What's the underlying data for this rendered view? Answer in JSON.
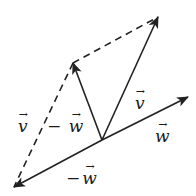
{
  "diagram": {
    "stroke_color": "#222222",
    "origin": [
      102,
      140
    ],
    "vectors": [
      {
        "name": "v",
        "from": [
          102,
          140
        ],
        "to": [
          158,
          17
        ],
        "style": "solid"
      },
      {
        "name": "w",
        "from": [
          102,
          140
        ],
        "to": [
          188,
          97
        ],
        "style": "solid"
      },
      {
        "name": "-w",
        "from": [
          102,
          140
        ],
        "to": [
          14,
          187
        ],
        "style": "solid"
      },
      {
        "name": "v-w",
        "from": [
          102,
          140
        ],
        "to": [
          73,
          63
        ],
        "style": "solid"
      }
    ],
    "dashed_lines": [
      {
        "from": [
          73,
          63
        ],
        "to": [
          158,
          17
        ]
      },
      {
        "from": [
          73,
          63
        ],
        "to": [
          14,
          187
        ]
      }
    ],
    "labels": {
      "v": {
        "sym": "v"
      },
      "w": {
        "sym": "w"
      },
      "neg_w": {
        "minus": "−",
        "sym": "w"
      },
      "v_minus_w": {
        "left": "v",
        "minus": "−",
        "right": "w"
      }
    }
  }
}
